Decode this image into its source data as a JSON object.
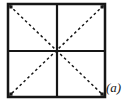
{
  "figure": {
    "label": "(a)"
  },
  "colors": {
    "background": "#ffffff",
    "line": "#161616"
  }
}
